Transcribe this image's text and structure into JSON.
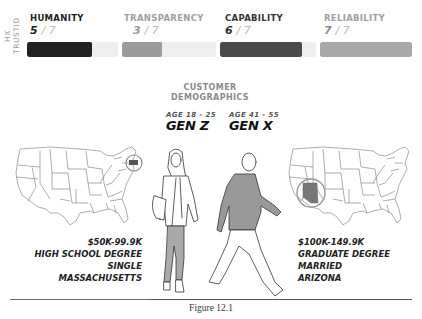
{
  "vertical_label": "HX TRUSTID",
  "metrics": [
    {
      "name": "HUMANITY",
      "score": "5",
      "denominator": "/ 7",
      "value": 5,
      "max": 7,
      "name_color": "#222222",
      "score_color": "#222222",
      "fill_color": "#222222"
    },
    {
      "name": "TRANSPARENCY",
      "score": "3",
      "denominator": "/ 7",
      "value": 3,
      "max": 7,
      "name_color": "#a0a0a0",
      "score_color": "#9a9a9a",
      "fill_color": "#9b9b9b"
    },
    {
      "name": "CAPABILITY",
      "score": "6",
      "denominator": "/ 7",
      "value": 6,
      "max": 7,
      "name_color": "#333333",
      "score_color": "#333333",
      "fill_color": "#4a4a4a"
    },
    {
      "name": "RELIABILITY",
      "score": "7",
      "denominator": "/ 7",
      "value": 7,
      "max": 7,
      "name_color": "#a0a0a0",
      "score_color": "#8a8a8a",
      "fill_color": "#a9a9a9"
    }
  ],
  "demographics": {
    "title_line1": "CUSTOMER",
    "title_line2": "DEMOGRAPHICS",
    "personas": [
      {
        "age": "AGE  18 - 25",
        "generation": "GEN Z",
        "details": [
          "$50K-99.9K",
          "HIGH SCHOOL DEGREE",
          "SINGLE",
          "MASSACHUSETTS"
        ],
        "highlight_state": "Massachusetts"
      },
      {
        "age": "AGE  41 - 55",
        "generation": "GEN X",
        "details": [
          "$100K-149.9K",
          "GRADUATE DEGREE",
          "MARRIED",
          "ARIZONA"
        ],
        "highlight_state": "Arizona"
      }
    ]
  },
  "caption": "Figure 12.1",
  "colors": {
    "highlight_fill": "#777777",
    "highlight_ring": "#8a8a8a",
    "track": "#eeeeee"
  }
}
